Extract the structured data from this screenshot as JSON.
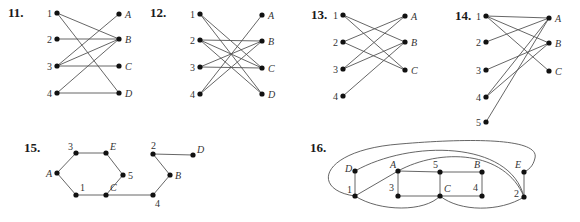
{
  "graphs": [
    {
      "id": "11",
      "label": "11.",
      "label_pos": [
        8,
        17
      ],
      "type": "bipartite",
      "nodes": [
        {
          "name": "1",
          "x": 57,
          "y": 13,
          "lx": -10,
          "ly": 4,
          "italic": false
        },
        {
          "name": "2",
          "x": 57,
          "y": 39,
          "lx": -10,
          "ly": 4,
          "italic": false
        },
        {
          "name": "3",
          "x": 57,
          "y": 66,
          "lx": -10,
          "ly": 4,
          "italic": false
        },
        {
          "name": "4",
          "x": 57,
          "y": 93,
          "lx": -10,
          "ly": 4,
          "italic": false
        },
        {
          "name": "A",
          "x": 119,
          "y": 14,
          "lx": 6,
          "ly": 4,
          "italic": true
        },
        {
          "name": "B",
          "x": 119,
          "y": 39,
          "lx": 6,
          "ly": 4,
          "italic": true
        },
        {
          "name": "C",
          "x": 119,
          "y": 66,
          "lx": 6,
          "ly": 4,
          "italic": true
        },
        {
          "name": "D",
          "x": 119,
          "y": 93,
          "lx": 6,
          "ly": 4,
          "italic": true
        }
      ],
      "edges": [
        [
          "1",
          "B"
        ],
        [
          "1",
          "D"
        ],
        [
          "2",
          "B"
        ],
        [
          "3",
          "A"
        ],
        [
          "3",
          "B"
        ],
        [
          "3",
          "C"
        ],
        [
          "4",
          "B"
        ],
        [
          "4",
          "D"
        ]
      ]
    },
    {
      "id": "12",
      "label": "12.",
      "label_pos": [
        150,
        17
      ],
      "type": "bipartite",
      "nodes": [
        {
          "name": "1",
          "x": 200,
          "y": 14,
          "lx": -10,
          "ly": 4,
          "italic": false
        },
        {
          "name": "2",
          "x": 200,
          "y": 40,
          "lx": -10,
          "ly": 4,
          "italic": false
        },
        {
          "name": "3",
          "x": 200,
          "y": 67,
          "lx": -10,
          "ly": 4,
          "italic": false
        },
        {
          "name": "4",
          "x": 200,
          "y": 94,
          "lx": -10,
          "ly": 4,
          "italic": false
        },
        {
          "name": "A",
          "x": 262,
          "y": 15,
          "lx": 6,
          "ly": 4,
          "italic": true
        },
        {
          "name": "B",
          "x": 262,
          "y": 41,
          "lx": 6,
          "ly": 4,
          "italic": true
        },
        {
          "name": "C",
          "x": 262,
          "y": 68,
          "lx": 6,
          "ly": 4,
          "italic": true
        },
        {
          "name": "D",
          "x": 262,
          "y": 94,
          "lx": 6,
          "ly": 4,
          "italic": true
        }
      ],
      "edges": [
        [
          "1",
          "C"
        ],
        [
          "1",
          "D"
        ],
        [
          "2",
          "B"
        ],
        [
          "2",
          "C"
        ],
        [
          "2",
          "D"
        ],
        [
          "3",
          "B"
        ],
        [
          "3",
          "C"
        ],
        [
          "4",
          "A"
        ],
        [
          "4",
          "B"
        ]
      ]
    },
    {
      "id": "13",
      "label": "13.",
      "label_pos": [
        311,
        19
      ],
      "type": "bipartite",
      "nodes": [
        {
          "name": "1",
          "x": 343,
          "y": 15,
          "lx": -10,
          "ly": 4,
          "italic": false
        },
        {
          "name": "2",
          "x": 343,
          "y": 42,
          "lx": -10,
          "ly": 4,
          "italic": false
        },
        {
          "name": "3",
          "x": 343,
          "y": 69,
          "lx": -10,
          "ly": 4,
          "italic": false
        },
        {
          "name": "4",
          "x": 343,
          "y": 96,
          "lx": -10,
          "ly": 4,
          "italic": false
        },
        {
          "name": "A",
          "x": 405,
          "y": 16,
          "lx": 6,
          "ly": 4,
          "italic": true
        },
        {
          "name": "B",
          "x": 405,
          "y": 42,
          "lx": 6,
          "ly": 4,
          "italic": true
        },
        {
          "name": "C",
          "x": 405,
          "y": 70,
          "lx": 6,
          "ly": 4,
          "italic": true
        }
      ],
      "edges": [
        [
          "1",
          "B"
        ],
        [
          "1",
          "C"
        ],
        [
          "2",
          "A"
        ],
        [
          "2",
          "C"
        ],
        [
          "3",
          "A"
        ],
        [
          "3",
          "B"
        ],
        [
          "4",
          "B"
        ]
      ]
    },
    {
      "id": "14",
      "label": "14.",
      "label_pos": [
        455,
        20
      ],
      "type": "bipartite",
      "nodes": [
        {
          "name": "1",
          "x": 486,
          "y": 16,
          "lx": -10,
          "ly": 4,
          "italic": false
        },
        {
          "name": "2",
          "x": 486,
          "y": 42,
          "lx": -10,
          "ly": 4,
          "italic": false
        },
        {
          "name": "3",
          "x": 486,
          "y": 70,
          "lx": -10,
          "ly": 4,
          "italic": false
        },
        {
          "name": "4",
          "x": 486,
          "y": 97,
          "lx": -10,
          "ly": 4,
          "italic": false
        },
        {
          "name": "5",
          "x": 486,
          "y": 122,
          "lx": -10,
          "ly": 4,
          "italic": false
        },
        {
          "name": "A",
          "x": 549,
          "y": 18,
          "lx": 6,
          "ly": 4,
          "italic": true
        },
        {
          "name": "B",
          "x": 549,
          "y": 43,
          "lx": 6,
          "ly": 4,
          "italic": true
        },
        {
          "name": "C",
          "x": 549,
          "y": 71,
          "lx": 6,
          "ly": 4,
          "italic": true
        }
      ],
      "edges": [
        [
          "1",
          "A"
        ],
        [
          "1",
          "B"
        ],
        [
          "1",
          "C"
        ],
        [
          "2",
          "A"
        ],
        [
          "3",
          "B"
        ],
        [
          "4",
          "A"
        ],
        [
          "4",
          "B"
        ],
        [
          "5",
          "A"
        ]
      ]
    },
    {
      "id": "15",
      "label": "15.",
      "label_pos": [
        24,
        152
      ],
      "type": "general",
      "nodes": [
        {
          "name": "3",
          "x": 76,
          "y": 153,
          "lx": -8,
          "ly": -3,
          "italic": false
        },
        {
          "name": "E",
          "x": 106,
          "y": 153,
          "lx": 4,
          "ly": -3,
          "italic": true
        },
        {
          "name": "A",
          "x": 57,
          "y": 173,
          "lx": -11,
          "ly": 4,
          "italic": true
        },
        {
          "name": "5",
          "x": 123,
          "y": 175,
          "lx": 5,
          "ly": 4,
          "italic": false
        },
        {
          "name": "1",
          "x": 76,
          "y": 195,
          "lx": 4,
          "ly": -4,
          "italic": false
        },
        {
          "name": "C",
          "x": 106,
          "y": 195,
          "lx": 4,
          "ly": -4,
          "italic": true
        },
        {
          "name": "2",
          "x": 153,
          "y": 154,
          "lx": -2,
          "ly": -5,
          "italic": false
        },
        {
          "name": "D",
          "x": 193,
          "y": 155,
          "lx": 4,
          "ly": -2,
          "italic": true
        },
        {
          "name": "B",
          "x": 170,
          "y": 175,
          "lx": 5,
          "ly": 4,
          "italic": true
        },
        {
          "name": "4",
          "x": 153,
          "y": 195,
          "lx": 2,
          "ly": 12,
          "italic": false
        }
      ],
      "edges": [
        [
          "A",
          "3"
        ],
        [
          "3",
          "E"
        ],
        [
          "E",
          "5"
        ],
        [
          "5",
          "C"
        ],
        [
          "C",
          "1"
        ],
        [
          "1",
          "A"
        ],
        [
          "C",
          "4"
        ],
        [
          "4",
          "B"
        ],
        [
          "B",
          "2"
        ],
        [
          "2",
          "D"
        ]
      ]
    },
    {
      "id": "16",
      "label": "16.",
      "label_pos": [
        310,
        152
      ],
      "type": "general",
      "nodes": [
        {
          "name": "D",
          "x": 355,
          "y": 171,
          "lx": -10,
          "ly": 1,
          "italic": true
        },
        {
          "name": "1",
          "x": 355,
          "y": 196,
          "lx": -8,
          "ly": -3,
          "italic": false
        },
        {
          "name": "A",
          "x": 398,
          "y": 171,
          "lx": -8,
          "ly": -3,
          "italic": true
        },
        {
          "name": "3",
          "x": 398,
          "y": 196,
          "lx": -9,
          "ly": -5,
          "italic": false
        },
        {
          "name": "5",
          "x": 440,
          "y": 172,
          "lx": -7,
          "ly": -4,
          "italic": false
        },
        {
          "name": "C",
          "x": 440,
          "y": 196,
          "lx": 4,
          "ly": -4,
          "italic": true
        },
        {
          "name": "B",
          "x": 482,
          "y": 172,
          "lx": -8,
          "ly": -4,
          "italic": true
        },
        {
          "name": "4",
          "x": 482,
          "y": 196,
          "lx": -9,
          "ly": -5,
          "italic": false
        },
        {
          "name": "E",
          "x": 524,
          "y": 172,
          "lx": -9,
          "ly": -4,
          "italic": true
        },
        {
          "name": "2",
          "x": 524,
          "y": 197,
          "lx": -10,
          "ly": 0,
          "italic": false
        }
      ],
      "edges": [
        [
          "D",
          "1"
        ],
        [
          "1",
          "A"
        ],
        [
          "A",
          "5"
        ],
        [
          "5",
          "B"
        ],
        [
          "B",
          "4"
        ],
        [
          "4",
          "C"
        ],
        [
          "C",
          "3"
        ],
        [
          "3",
          "A"
        ],
        [
          "5",
          "C"
        ],
        [
          "E",
          "2"
        ]
      ],
      "curved_edges": [
        {
          "from": "1",
          "to": "C",
          "path": "M355,196 C380,212 425,212 440,196"
        },
        {
          "from": "C",
          "to": "2",
          "path": "M440,196 C460,212 500,212 524,197"
        },
        {
          "from": "A",
          "to": "2",
          "path": "M398,171 C440,148 505,150 524,197"
        },
        {
          "from": "D",
          "to": "2",
          "path": "M355,171 C410,140 510,140 524,197"
        },
        {
          "from": "1",
          "to": "E",
          "path": "M355,196 C310,190 320,150 400,144 C470,138 540,138 535,158 C533,167 528,170 524,172"
        }
      ]
    }
  ]
}
